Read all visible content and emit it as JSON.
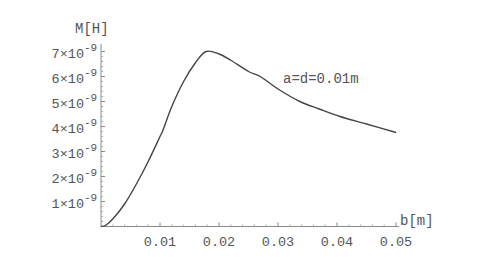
{
  "chart_data": {
    "type": "line",
    "title": "",
    "xlabel": "b[m]",
    "ylabel": "M[H]",
    "xlim": [
      0,
      0.05
    ],
    "ylim": [
      0,
      7.3e-09
    ],
    "grid": false,
    "legend": null,
    "x_ticks": [
      "0.01",
      "0.02",
      "0.03",
      "0.04",
      "0.05"
    ],
    "x_tick_values": [
      0.01,
      0.02,
      0.03,
      0.04,
      0.05
    ],
    "y_ticks": [
      {
        "mant": "1",
        "exp": "-9",
        "value": 1e-09
      },
      {
        "mant": "2",
        "exp": "-9",
        "value": 2e-09
      },
      {
        "mant": "3",
        "exp": "-9",
        "value": 3e-09
      },
      {
        "mant": "4",
        "exp": "-9",
        "value": 4e-09
      },
      {
        "mant": "5",
        "exp": "-9",
        "value": 5e-09
      },
      {
        "mant": "6",
        "exp": "-9",
        "value": 6e-09
      },
      {
        "mant": "7",
        "exp": "-9",
        "value": 7e-09
      }
    ],
    "annotations": [
      {
        "text": "a=d=0.01m",
        "x": 0.031,
        "y": 5.9e-09
      }
    ],
    "series": [
      {
        "name": "a=d=0.01m",
        "x": [
          0,
          0.0008,
          0.002,
          0.004,
          0.006,
          0.008,
          0.01,
          0.0105,
          0.012,
          0.014,
          0.016,
          0.0178,
          0.02,
          0.022,
          0.025,
          0.027,
          0.03,
          0.0337,
          0.037,
          0.0405,
          0.045,
          0.05
        ],
        "y": [
          0,
          5e-11,
          3e-10,
          9e-10,
          1.7e-09,
          2.6e-09,
          3.6e-09,
          3.85e-09,
          4.8e-09,
          5.8e-09,
          6.55e-09,
          7e-09,
          6.9e-09,
          6.65e-09,
          6.2e-09,
          6e-09,
          5.5e-09,
          5e-09,
          4.7e-09,
          4.4e-09,
          4.1e-09,
          3.76e-09
        ]
      }
    ]
  }
}
